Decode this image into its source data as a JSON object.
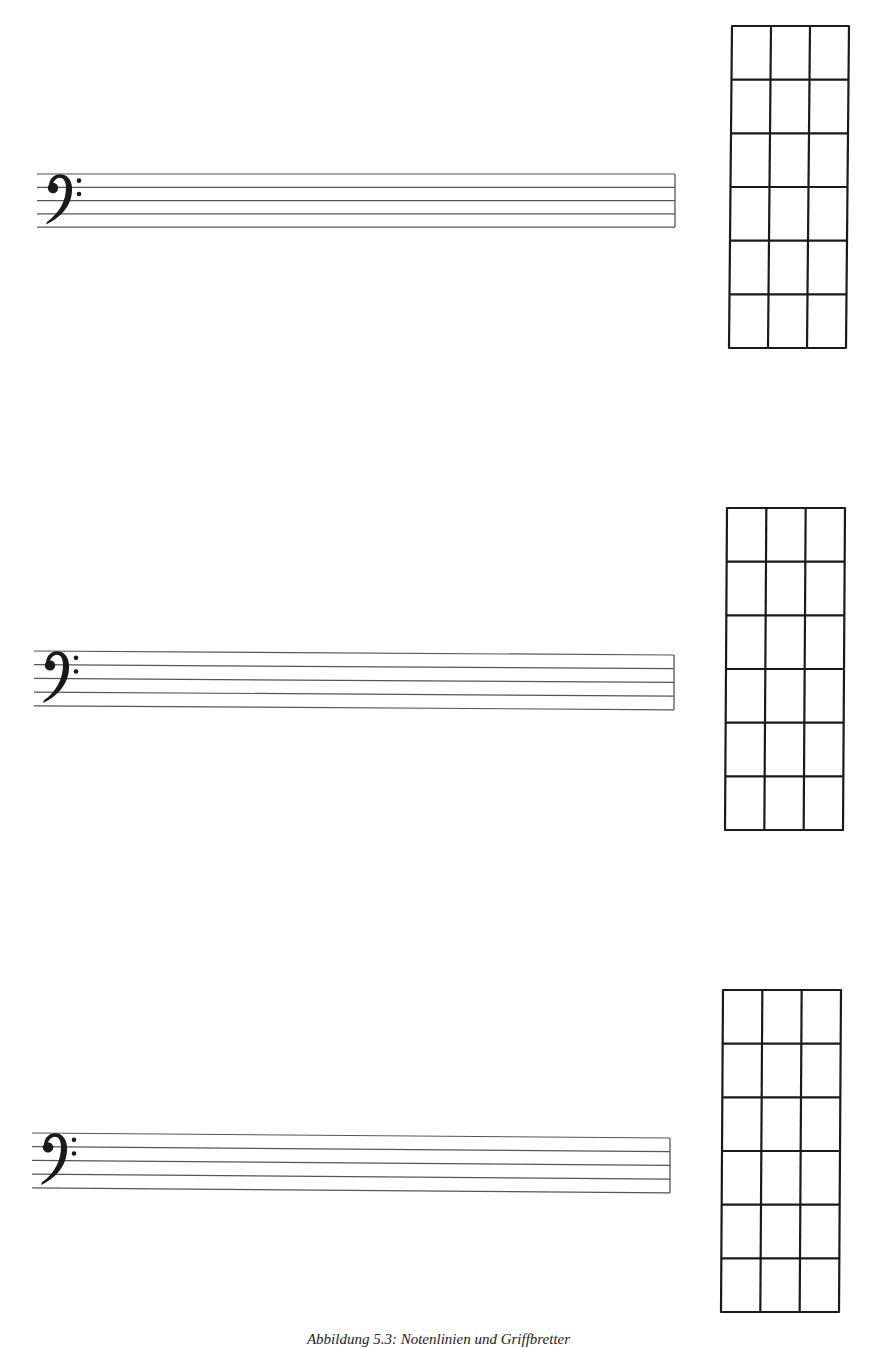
{
  "page": {
    "caption": "Abbildung 5.3: Notenlinien und Griffbretter",
    "ink_color": "#1a1a1a",
    "staff_line_color": "#555555"
  },
  "systems": [
    {
      "staff": {
        "clef": "bass-clef",
        "x1": 37,
        "x2": 675,
        "top_left": 174,
        "top_right": 174,
        "spacing": 13.3
      },
      "fretboard": {
        "x_tl": 732,
        "y_top": 26,
        "x_bl": 729,
        "y_bottom": 348,
        "width": 117,
        "strings": 4,
        "frets": 6
      }
    },
    {
      "staff": {
        "clef": "bass-clef",
        "x1": 34,
        "x2": 674,
        "top_left": 651,
        "top_right": 655,
        "spacing": 13.7
      },
      "fretboard": {
        "x_tl": 727,
        "y_top": 508,
        "x_bl": 725,
        "y_bottom": 830,
        "width": 118,
        "strings": 4,
        "frets": 6
      }
    },
    {
      "staff": {
        "clef": "bass-clef",
        "x1": 32,
        "x2": 670,
        "top_left": 1133,
        "top_right": 1138,
        "spacing": 13.7
      },
      "fretboard": {
        "x_tl": 723,
        "y_top": 990,
        "x_bl": 721,
        "y_bottom": 1312,
        "width": 118,
        "strings": 4,
        "frets": 6
      }
    }
  ]
}
